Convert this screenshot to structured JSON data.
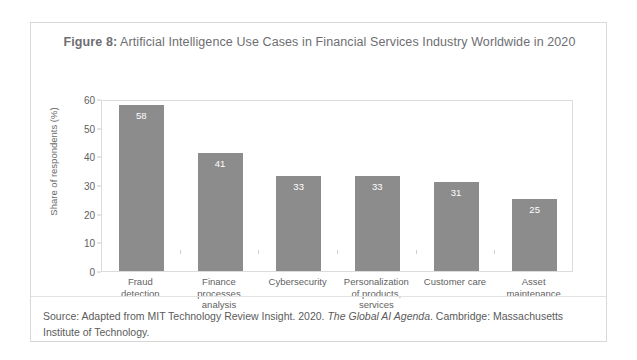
{
  "figure": {
    "label": "Figure 8:",
    "title_rest": " Artificial Intelligence Use Cases in Financial Services Industry Worldwide in 2020"
  },
  "source": {
    "prefix": "Source: Adapted from MIT Technology Review Insight. 2020. ",
    "italic_title": "The Global AI Agenda",
    "suffix": ". Cambridge: Massachusetts Institute of Technology."
  },
  "colors": {
    "bar": "#8c8c8c",
    "text": "#5f5f5f",
    "title": "#6e6e72",
    "frame": "#dcdcdc",
    "value_label": "#ffffff"
  },
  "chart_data": {
    "type": "bar",
    "title": "Figure 8: Artificial Intelligence Use Cases in Financial Services Industry Worldwide in 2020",
    "xlabel": "",
    "ylabel": "Share of respondents (%)",
    "ylim": [
      0,
      60
    ],
    "yticks": [
      0,
      10,
      20,
      30,
      40,
      50,
      60
    ],
    "ytick_labels": [
      "0",
      "10",
      "20",
      "30",
      "40",
      "50",
      "60"
    ],
    "grid": false,
    "legend": false,
    "categories": [
      "Fraud detection",
      "Finance processes analysis",
      "Cybersecurity",
      "Personalization of products, services",
      "Customer care",
      "Asset maintenance"
    ],
    "category_lines": [
      [
        "Fraud",
        "detection"
      ],
      [
        "Finance",
        "processes",
        "analysis"
      ],
      [
        "Cybersecurity"
      ],
      [
        "Personalization",
        "of products,",
        "services"
      ],
      [
        "Customer care"
      ],
      [
        "Asset",
        "maintenance"
      ]
    ],
    "values": [
      58,
      41,
      33,
      33,
      31,
      25
    ],
    "value_labels": [
      "58",
      "41",
      "33",
      "33",
      "31",
      "25"
    ]
  }
}
